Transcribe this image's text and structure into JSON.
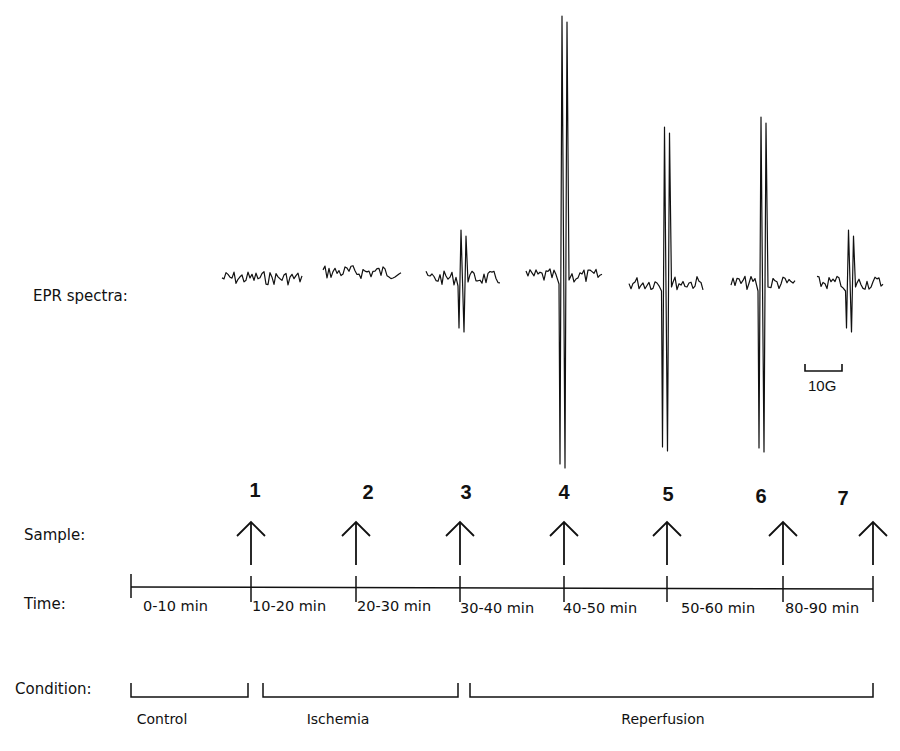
{
  "labels": {
    "epr": "EPR spectra:",
    "sample": "Sample:",
    "time": "Time:",
    "condition": "Condition:"
  },
  "scale_bar": {
    "label": "10G"
  },
  "samples": [
    {
      "id": "1",
      "x": 251
    },
    {
      "id": "2",
      "x": 356
    },
    {
      "id": "3",
      "x": 460
    },
    {
      "id": "4",
      "x": 564
    },
    {
      "id": "5",
      "x": 667
    },
    {
      "id": "6",
      "x": 783
    },
    {
      "id": "7",
      "x": 873
    }
  ],
  "time_intervals": [
    "0-10 min",
    "10-20 min",
    "20-30 min",
    "30-40 min",
    "40-50 min",
    "50-60 min",
    "80-90 min"
  ],
  "conditions": [
    {
      "label": "Control",
      "x1": 131,
      "x2": 248
    },
    {
      "label": "Ischemia",
      "x1": 263,
      "x2": 458
    },
    {
      "label": "Reperfusion",
      "x1": 470,
      "x2": 873
    }
  ],
  "chart_data": {
    "type": "line",
    "xlabel": "Magnetic field (scale bar 10G)",
    "ylabel": "EPR signal intensity (relative)",
    "series": [
      {
        "name": "Sample 1 (Control, 0-10 min)",
        "peak_amplitude": 0
      },
      {
        "name": "Sample 2 (Ischemia, 10-20 min)",
        "peak_amplitude": 0
      },
      {
        "name": "Sample 3 (Ischemia, 20-30 min)",
        "peak_amplitude": 35
      },
      {
        "name": "Sample 4 (Reperfusion, 30-40 min)",
        "peak_amplitude": 170
      },
      {
        "name": "Sample 5 (Reperfusion, 40-50 min)",
        "peak_amplitude": 105
      },
      {
        "name": "Sample 6 (Reperfusion, 50-60 min)",
        "peak_amplitude": 110
      },
      {
        "name": "Sample 7 (Reperfusion, 80-90 min)",
        "peak_amplitude": 38
      }
    ],
    "spectra_layout": [
      {
        "x0": 222,
        "x1": 302,
        "base": 278,
        "up": 0,
        "down": 0
      },
      {
        "x0": 323,
        "x1": 402,
        "base": 272,
        "up": 0,
        "down": 0
      },
      {
        "x0": 426,
        "x1": 500,
        "base": 278,
        "up": 48,
        "down": 50
      },
      {
        "x0": 526,
        "x1": 602,
        "base": 276,
        "up": 260,
        "down": 188
      },
      {
        "x0": 629,
        "x1": 704,
        "base": 283,
        "up": 156,
        "down": 164
      },
      {
        "x0": 731,
        "x1": 795,
        "base": 283,
        "up": 166,
        "down": 165
      },
      {
        "x0": 817,
        "x1": 884,
        "base": 283,
        "up": 53,
        "down": 45
      }
    ]
  }
}
